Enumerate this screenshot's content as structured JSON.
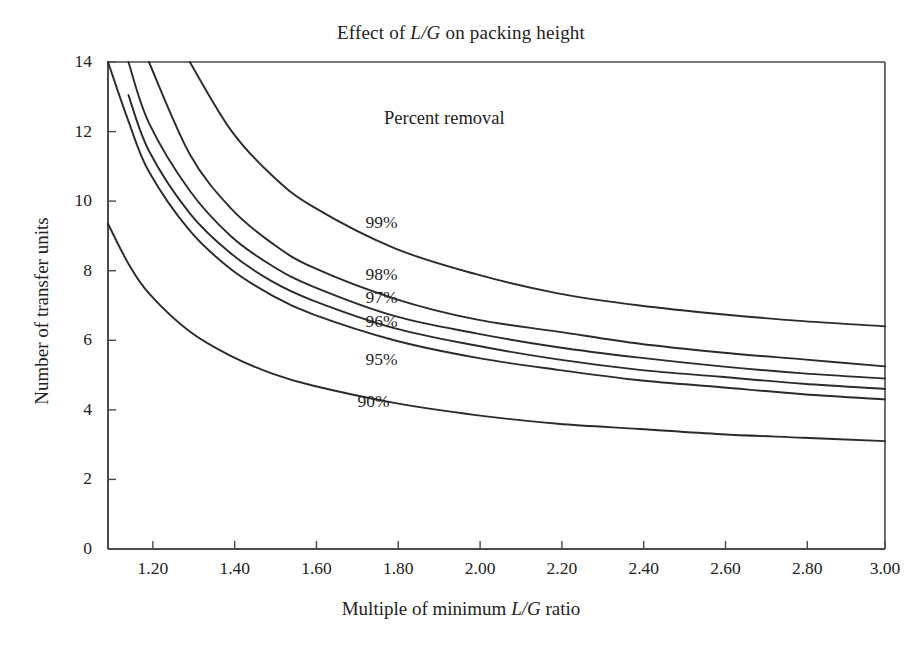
{
  "figure": {
    "title_prefix": "Effect of ",
    "title_italic": "L/G",
    "title_suffix": " on packing height",
    "title_plain": "Effect of L/G on packing height",
    "background_color": "#ffffff",
    "line_color": "#2b2b2b",
    "axis_color": "#4a4a4a"
  },
  "axes": {
    "x": {
      "label_prefix": "Multiple of minimum ",
      "label_italic": "L/G",
      "label_suffix": " ratio",
      "label_plain": "Multiple of minimum L/G ratio",
      "ticks": [
        "1.20",
        "1.40",
        "1.60",
        "1.80",
        "2.00",
        "2.20",
        "2.40",
        "2.60",
        "2.80",
        "3.00"
      ],
      "min": 1.1,
      "max": 3.0
    },
    "y": {
      "label": "Number of transfer units",
      "ticks": [
        "0",
        "2",
        "4",
        "6",
        "8",
        "10",
        "12",
        "14"
      ],
      "min": 0,
      "max": 14
    }
  },
  "annotations": {
    "percent_removal": "Percent removal"
  },
  "chart_data": {
    "type": "line",
    "title": "Effect of L/G on packing height",
    "xlabel": "Multiple of minimum L/G ratio",
    "ylabel": "Number of transfer units",
    "xlim": [
      1.1,
      3.0
    ],
    "ylim": [
      0,
      14
    ],
    "grid": false,
    "legend": "inline-curve-labels",
    "x": [
      1.1,
      1.15,
      1.2,
      1.3,
      1.4,
      1.5,
      1.6,
      1.8,
      2.0,
      2.2,
      2.4,
      2.6,
      2.8,
      3.0
    ],
    "series": [
      {
        "name": "99%",
        "label": "99%",
        "label_x": 1.73,
        "label_y": 9.4,
        "values": [
          null,
          null,
          null,
          14.0,
          12.05,
          10.75,
          9.85,
          8.65,
          7.9,
          7.35,
          7.0,
          6.75,
          6.55,
          6.4
        ]
      },
      {
        "name": "98%",
        "label": "98%",
        "label_x": 1.73,
        "label_y": 7.9,
        "values": [
          null,
          null,
          14.0,
          11.35,
          9.8,
          8.8,
          8.1,
          7.2,
          6.6,
          6.25,
          5.9,
          5.65,
          5.45,
          5.25
        ]
      },
      {
        "name": "97%",
        "label": "97%",
        "label_x": 1.73,
        "label_y": 7.25,
        "values": [
          null,
          14.0,
          12.25,
          10.3,
          9.0,
          8.15,
          7.55,
          6.7,
          6.2,
          5.8,
          5.5,
          5.25,
          5.05,
          4.9
        ]
      },
      {
        "name": "96%",
        "label": "96%",
        "label_x": 1.73,
        "label_y": 6.55,
        "values": [
          null,
          13.05,
          11.45,
          9.65,
          8.5,
          7.7,
          7.15,
          6.35,
          5.85,
          5.45,
          5.15,
          4.95,
          4.75,
          4.6
        ]
      },
      {
        "name": "95%",
        "label": "95%",
        "label_x": 1.73,
        "label_y": 5.45,
        "values": [
          14.0,
          12.3,
          10.85,
          9.15,
          8.05,
          7.3,
          6.75,
          6.0,
          5.5,
          5.15,
          4.85,
          4.65,
          4.45,
          4.3
        ]
      },
      {
        "name": "90%",
        "label": "90%",
        "label_x": 1.71,
        "label_y": 4.25,
        "values": [
          9.35,
          8.2,
          7.35,
          6.25,
          5.55,
          5.05,
          4.7,
          4.2,
          3.85,
          3.6,
          3.45,
          3.3,
          3.2,
          3.1
        ]
      }
    ]
  }
}
